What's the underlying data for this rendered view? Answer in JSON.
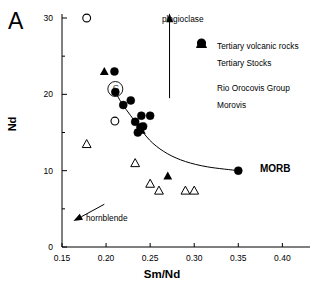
{
  "panel": {
    "label": "A"
  },
  "axes": {
    "xlabel": "Sm/Nd",
    "ylabel": "Nd",
    "xticks": [
      "0.15",
      "0.20",
      "0.25",
      "0.30",
      "0.35",
      "0.40"
    ],
    "yticks": [
      "0",
      "10",
      "20",
      "30"
    ]
  },
  "legend": {
    "items": [
      {
        "label": "Tertiary volcanic rocks",
        "symbol": "filled-triangle"
      },
      {
        "label": "Tertiary Stocks",
        "symbol": "open-triangle"
      },
      {
        "label": "Rio Orocovis Group",
        "symbol": "filled-circle"
      },
      {
        "label": "Morovis",
        "symbol": "open-circle"
      }
    ]
  },
  "annotations": {
    "plagioclase": "plagioclase",
    "hornblende": "hornblende",
    "morb": "MORB",
    "circled": "C"
  },
  "chart_data": {
    "type": "scatter",
    "title": "",
    "xlabel": "Sm/Nd",
    "ylabel": "Nd",
    "xlim": [
      0.15,
      0.42
    ],
    "ylim": [
      0,
      30
    ],
    "xticks": [
      0.15,
      0.2,
      0.25,
      0.3,
      0.35,
      0.4
    ],
    "yticks": [
      0,
      10,
      20,
      30
    ],
    "yminorticks": [
      5,
      15,
      25
    ],
    "grid": false,
    "legend_position": "upper-right",
    "series": [
      {
        "name": "Tertiary volcanic rocks",
        "marker": "filled-triangle",
        "color": "#000000",
        "points": [
          {
            "x": 0.198,
            "y": 23.0
          },
          {
            "x": 0.24,
            "y": 15.3
          },
          {
            "x": 0.27,
            "y": 9.3
          }
        ]
      },
      {
        "name": "Tertiary Stocks",
        "marker": "open-triangle",
        "color": "#000000",
        "points": [
          {
            "x": 0.178,
            "y": 13.5
          },
          {
            "x": 0.233,
            "y": 11.0
          },
          {
            "x": 0.25,
            "y": 8.3
          },
          {
            "x": 0.26,
            "y": 7.4
          },
          {
            "x": 0.29,
            "y": 7.4
          },
          {
            "x": 0.3,
            "y": 7.4
          }
        ]
      },
      {
        "name": "Rio Orocovis Group",
        "marker": "filled-circle",
        "color": "#000000",
        "points": [
          {
            "x": 0.2095,
            "y": 23.0
          },
          {
            "x": 0.2105,
            "y": 20.3
          },
          {
            "x": 0.2195,
            "y": 18.6
          },
          {
            "x": 0.228,
            "y": 19.2
          },
          {
            "x": 0.233,
            "y": 16.4
          },
          {
            "x": 0.24,
            "y": 17.2
          },
          {
            "x": 0.25,
            "y": 17.2
          },
          {
            "x": 0.242,
            "y": 15.8
          },
          {
            "x": 0.239,
            "y": 15.7
          },
          {
            "x": 0.236,
            "y": 15.0
          },
          {
            "x": 0.35,
            "y": 10.0
          }
        ]
      },
      {
        "name": "Morovis",
        "marker": "open-circle",
        "color": "#000000",
        "points": [
          {
            "x": 0.178,
            "y": 30.0
          },
          {
            "x": 0.21,
            "y": 16.5
          }
        ]
      }
    ],
    "curve": {
      "name": "mixing-curve",
      "points": [
        {
          "x": 0.209,
          "y": 20.6
        },
        {
          "x": 0.218,
          "y": 18.8
        },
        {
          "x": 0.228,
          "y": 17.2
        },
        {
          "x": 0.24,
          "y": 15.3
        },
        {
          "x": 0.253,
          "y": 13.6
        },
        {
          "x": 0.27,
          "y": 12.2
        },
        {
          "x": 0.29,
          "y": 11.2
        },
        {
          "x": 0.315,
          "y": 10.5
        },
        {
          "x": 0.35,
          "y": 10.0
        }
      ]
    },
    "vectors": [
      {
        "label": "plagioclase",
        "direction": "up",
        "x": 0.272,
        "y_from": 19.5,
        "y_to": 30.5
      },
      {
        "label": "hornblende",
        "direction": "down-left",
        "x_from": 0.198,
        "y_from": 5.6,
        "x_to": 0.163,
        "y_to": 3.4
      }
    ],
    "highlight": {
      "label": "C",
      "x": 0.2105,
      "y": 20.5,
      "shape": "circle-outline"
    }
  }
}
